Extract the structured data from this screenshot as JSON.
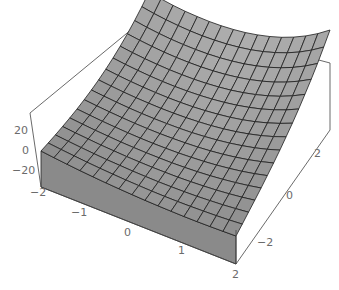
{
  "chart_data": {
    "type": "surface3d",
    "title": "",
    "xlabel": "",
    "ylabel": "",
    "zlabel": "",
    "x_range": [
      -2,
      2
    ],
    "y_range": [
      -2,
      2
    ],
    "z_range": [
      -30,
      30
    ],
    "grid_lines_on_surface": 15,
    "x_ticks": [
      "-2",
      "-1",
      "0",
      "1",
      "2"
    ],
    "y_ticks": [
      "-2",
      "0",
      "2"
    ],
    "z_ticks": [
      "20",
      "0",
      "-20"
    ],
    "surface_color": "#9a9a9a",
    "mesh_color": "#1e1e1e",
    "box": true
  },
  "axes": {
    "x_tick_labels": [
      {
        "text": "-2",
        "x": 30,
        "y": 196
      },
      {
        "text": "-1",
        "x": 71,
        "y": 216
      },
      {
        "text": "0",
        "x": 124,
        "y": 236
      },
      {
        "text": "1",
        "x": 178,
        "y": 254
      },
      {
        "text": "2",
        "x": 232,
        "y": 278
      }
    ],
    "y_tick_labels": [
      {
        "text": "-2",
        "x": 257,
        "y": 246
      },
      {
        "text": "0",
        "x": 286,
        "y": 199
      },
      {
        "text": "2",
        "x": 314,
        "y": 157
      }
    ],
    "z_tick_labels": [
      {
        "text": "20",
        "x": 14,
        "y": 134
      },
      {
        "text": "0",
        "x": 22,
        "y": 154
      },
      {
        "text": "-20",
        "x": 12,
        "y": 174
      }
    ]
  }
}
